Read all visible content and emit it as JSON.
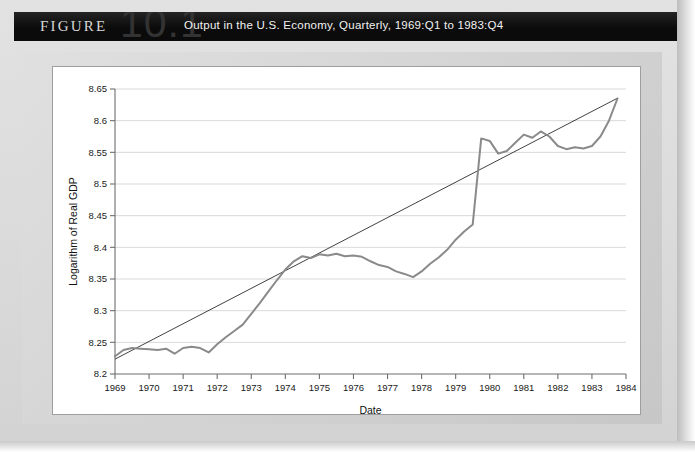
{
  "banner": {
    "figure_word": "FIGURE",
    "figure_number": "10.1",
    "title": "Output in the U.S. Economy, Quarterly, 1969:Q1 to 1983:Q4"
  },
  "chart_data": {
    "type": "line",
    "title": "Output in the U.S. Economy, Quarterly, 1969:Q1 to 1983:Q4",
    "xlabel": "Date",
    "ylabel": "Logarithm of Real GDP",
    "xlim": [
      1969,
      1984
    ],
    "ylim": [
      8.2,
      8.65
    ],
    "grid": "horizontal",
    "legend": "none",
    "xticks": [
      "1969",
      "1970",
      "1971",
      "1972",
      "1973",
      "1974",
      "1975",
      "1976",
      "1977",
      "1978",
      "1979",
      "1980",
      "1981",
      "1982",
      "1983",
      "1984"
    ],
    "yticks": [
      "8.2",
      "8.25",
      "8.3",
      "8.35",
      "8.4",
      "8.45",
      "8.5",
      "8.55",
      "8.6",
      "8.65"
    ],
    "series": [
      {
        "name": "Logarithm of Real GDP",
        "color": "#8a8a8a",
        "x": [
          1969.0,
          1969.25,
          1969.5,
          1969.75,
          1970.0,
          1970.25,
          1970.5,
          1970.75,
          1971.0,
          1971.25,
          1971.5,
          1971.75,
          1972.0,
          1972.25,
          1972.5,
          1972.75,
          1973.0,
          1973.25,
          1973.5,
          1973.75,
          1974.0,
          1974.25,
          1974.5,
          1974.75,
          1975.0,
          1975.25,
          1975.5,
          1975.75,
          1976.0,
          1976.25,
          1976.5,
          1976.75,
          1977.0,
          1977.25,
          1977.5,
          1977.75,
          1978.0,
          1978.25,
          1978.5,
          1978.75,
          1979.0,
          1979.25,
          1979.5,
          1979.75,
          1980.0,
          1980.25,
          1980.5,
          1980.75,
          1981.0,
          1981.25,
          1981.5,
          1981.75,
          1982.0,
          1982.25,
          1982.5,
          1982.75,
          1983.0,
          1983.25,
          1983.5,
          1983.75
        ],
        "y": [
          8.228,
          8.238,
          8.241,
          8.24,
          8.239,
          8.238,
          8.24,
          8.232,
          8.241,
          8.243,
          8.241,
          8.234,
          8.247,
          8.258,
          8.268,
          8.278,
          8.295,
          8.312,
          8.33,
          8.348,
          8.365,
          8.378,
          8.386,
          8.383,
          8.389,
          8.387,
          8.39,
          8.386,
          8.387,
          8.385,
          8.378,
          8.372,
          8.369,
          8.362,
          8.358,
          8.353,
          8.362,
          8.374,
          8.384,
          8.396,
          8.412,
          8.425,
          8.436,
          8.448,
          8.462,
          8.478,
          8.492,
          8.504,
          8.505,
          8.523,
          8.545,
          8.556,
          8.565,
          8.57,
          8.572,
          8.572,
          8.571,
          8.57,
          8.571,
          8.552
        ],
        "note": "quarterly log real GDP 1969:Q1-1983:Q4 (continues below)"
      }
    ],
    "series_continued": {
      "x": [
        1979.75,
        1980.0,
        1980.25,
        1980.5,
        1980.75,
        1981.0,
        1981.25,
        1981.5,
        1981.75,
        1982.0,
        1982.25,
        1982.5,
        1982.75,
        1983.0,
        1983.25,
        1983.5,
        1983.75
      ],
      "y": [
        8.572,
        8.568,
        8.548,
        8.552,
        8.565,
        8.578,
        8.573,
        8.583,
        8.575,
        8.56,
        8.555,
        8.558,
        8.556,
        8.56,
        8.575,
        8.6,
        8.635
      ]
    },
    "trend": {
      "name": "linear trend",
      "color": "#2b2b2b",
      "x": [
        1969.0,
        1983.75
      ],
      "y": [
        8.2235,
        8.6355
      ]
    },
    "annotations": []
  }
}
